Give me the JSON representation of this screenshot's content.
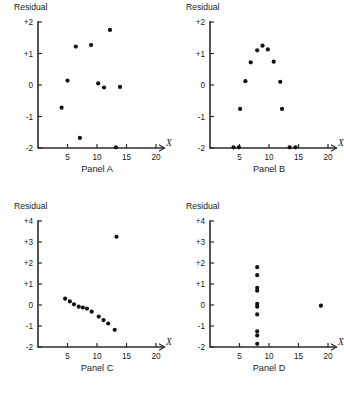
{
  "figure": {
    "panel_count": 4,
    "ylabel": "Residual",
    "xlabel": "X"
  },
  "chart_data": [
    {
      "type": "scatter",
      "title": "Panel A",
      "xlabel": "X",
      "ylabel": "Residual",
      "xlim": [
        0,
        20
      ],
      "ylim": [
        -2,
        2
      ],
      "xticks": [
        5,
        10,
        15,
        20
      ],
      "xticklabels": [
        "5",
        "10",
        "15",
        "20"
      ],
      "yticks": [
        -2,
        -1,
        0,
        1,
        2
      ],
      "yticklabels": [
        "-2",
        "-1",
        "0",
        "+1",
        "+2"
      ],
      "grid": false,
      "legend": "none",
      "points": [
        {
          "x": 4.0,
          "y": -0.72
        },
        {
          "x": 5.0,
          "y": 0.14
        },
        {
          "x": 6.4,
          "y": 1.22
        },
        {
          "x": 7.1,
          "y": -1.68
        },
        {
          "x": 9.0,
          "y": 1.27
        },
        {
          "x": 10.2,
          "y": 0.05
        },
        {
          "x": 11.2,
          "y": -0.08
        },
        {
          "x": 12.2,
          "y": 1.75
        },
        {
          "x": 13.2,
          "y": -1.98
        },
        {
          "x": 13.9,
          "y": -0.06
        }
      ]
    },
    {
      "type": "scatter",
      "title": "Panel B",
      "xlabel": "X",
      "ylabel": "Residual",
      "xlim": [
        0,
        20
      ],
      "ylim": [
        -2,
        2
      ],
      "xticks": [
        5,
        10,
        15,
        20
      ],
      "xticklabels": [
        "5",
        "10",
        "15",
        "20"
      ],
      "yticks": [
        -2,
        -1,
        0,
        1,
        2
      ],
      "yticklabels": [
        "-2",
        "-1",
        "0",
        "+1",
        "+2"
      ],
      "grid": false,
      "legend": "none",
      "points": [
        {
          "x": 4.0,
          "y": -1.98
        },
        {
          "x": 4.9,
          "y": -1.98
        },
        {
          "x": 5.1,
          "y": -0.76
        },
        {
          "x": 6.0,
          "y": 0.12
        },
        {
          "x": 6.9,
          "y": 0.72
        },
        {
          "x": 8.0,
          "y": 1.1
        },
        {
          "x": 8.9,
          "y": 1.25
        },
        {
          "x": 9.8,
          "y": 1.13
        },
        {
          "x": 10.8,
          "y": 0.74
        },
        {
          "x": 11.9,
          "y": 0.1
        },
        {
          "x": 12.2,
          "y": -0.76
        },
        {
          "x": 13.5,
          "y": -1.98
        },
        {
          "x": 14.5,
          "y": -1.98
        }
      ]
    },
    {
      "type": "scatter",
      "title": "Panel C",
      "xlabel": "X",
      "ylabel": "Residual",
      "xlim": [
        0,
        20
      ],
      "ylim": [
        -2,
        4
      ],
      "xticks": [
        5,
        10,
        15,
        20
      ],
      "xticklabels": [
        "5",
        "10",
        "15",
        "20"
      ],
      "yticks": [
        -2,
        -1,
        0,
        1,
        2,
        3,
        4
      ],
      "yticklabels": [
        "-2",
        "-1",
        "0",
        "+1",
        "+2",
        "+3",
        "+4"
      ],
      "grid": false,
      "legend": "none",
      "points": [
        {
          "x": 4.6,
          "y": 0.3
        },
        {
          "x": 5.4,
          "y": 0.17
        },
        {
          "x": 6.1,
          "y": 0.03
        },
        {
          "x": 6.9,
          "y": -0.08
        },
        {
          "x": 7.6,
          "y": -0.12
        },
        {
          "x": 8.3,
          "y": -0.17
        },
        {
          "x": 9.1,
          "y": -0.32
        },
        {
          "x": 10.3,
          "y": -0.55
        },
        {
          "x": 11.1,
          "y": -0.72
        },
        {
          "x": 11.9,
          "y": -0.88
        },
        {
          "x": 13.0,
          "y": -1.18
        },
        {
          "x": 13.3,
          "y": 3.25
        }
      ]
    },
    {
      "type": "scatter",
      "title": "Panel D",
      "xlabel": "X",
      "ylabel": "Residual",
      "xlim": [
        0,
        20
      ],
      "ylim": [
        -2,
        4
      ],
      "xticks": [
        5,
        10,
        15,
        20
      ],
      "xticklabels": [
        "5",
        "10",
        "15",
        "20"
      ],
      "yticks": [
        -2,
        -1,
        0,
        1,
        2,
        3,
        4
      ],
      "yticklabels": [
        "-2",
        "-1",
        "0",
        "+1",
        "+2",
        "+3",
        "+4"
      ],
      "grid": false,
      "legend": "none",
      "points": [
        {
          "x": 8.0,
          "y": 1.8
        },
        {
          "x": 8.0,
          "y": 1.42
        },
        {
          "x": 8.0,
          "y": 0.82
        },
        {
          "x": 8.0,
          "y": 0.68
        },
        {
          "x": 8.0,
          "y": 0.05
        },
        {
          "x": 8.0,
          "y": -0.08
        },
        {
          "x": 8.0,
          "y": -0.45
        },
        {
          "x": 8.0,
          "y": -1.25
        },
        {
          "x": 8.0,
          "y": -1.45
        },
        {
          "x": 8.0,
          "y": -1.85
        },
        {
          "x": 18.8,
          "y": -0.03
        }
      ]
    }
  ]
}
